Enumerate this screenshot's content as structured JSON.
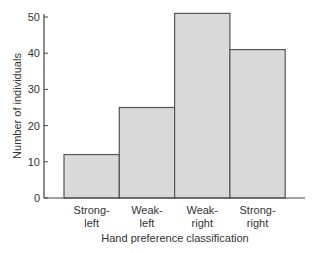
{
  "chart_data": {
    "type": "bar",
    "title": "",
    "xlabel": "Hand preference classification",
    "ylabel": "Number of individuals",
    "categories": [
      "Strong-\nleft",
      "Weak-\nleft",
      "Weak-\nright",
      "Strong-\nright"
    ],
    "category_lines": [
      [
        "Strong-",
        "left"
      ],
      [
        "Weak-",
        "left"
      ],
      [
        "Weak-",
        "right"
      ],
      [
        "Strong-",
        "right"
      ]
    ],
    "values": [
      12,
      25,
      51,
      41
    ],
    "ylim": [
      0,
      52
    ],
    "yticks": [
      0,
      10,
      20,
      30,
      40,
      50
    ],
    "grid": false,
    "legend": null,
    "bar_color": "#d9d9d9",
    "edge_color": "#555555"
  },
  "axes": {
    "ytick_labels": [
      "0",
      "10",
      "20",
      "30",
      "40",
      "50"
    ]
  }
}
